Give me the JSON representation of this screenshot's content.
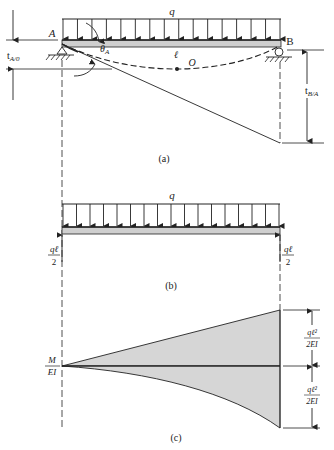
{
  "figure": {
    "colors": {
      "line": "#222222",
      "beam_fill": "#cfcfcf",
      "diagram_fill": "#d6d6d6",
      "background": "#ffffff"
    },
    "panel_a": {
      "caption": "(a)",
      "load_label": "q",
      "left_support_label": "A",
      "right_support_label": "B",
      "span_label": "ℓ",
      "point_label": "O",
      "angle_label": "θ",
      "angle_sub": "A",
      "tA0_label": "t",
      "tA0_sub": "A/0",
      "tBA_label": "t",
      "tBA_sub": "B/A",
      "load_arrow_count": 16
    },
    "panel_b": {
      "caption": "(b)",
      "load_label": "q",
      "left_reaction_num": "qℓ",
      "left_reaction_den": "2",
      "right_reaction_num": "qℓ",
      "right_reaction_den": "2",
      "load_arrow_count": 17
    },
    "panel_c": {
      "caption": "(c)",
      "axis_label_num": "M",
      "axis_label_den": "EI",
      "upper_dim_num": "qℓ²",
      "upper_dim_den": "2EI",
      "lower_dim_num": "qℓ²",
      "lower_dim_den": "2EI"
    }
  }
}
